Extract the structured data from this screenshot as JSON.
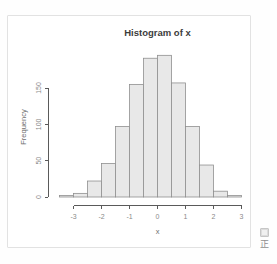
{
  "page": {
    "background": "#fefefe",
    "card_border_color": "#e2e2e2",
    "card_background": "#ffffff"
  },
  "chart_data": {
    "type": "bar",
    "subtype": "histogram",
    "title": "Histogram of x",
    "xlabel": "x",
    "ylabel": "Frequency",
    "bin_edges": [
      -3.5,
      -3,
      -2.5,
      -2,
      -1.5,
      -1,
      -0.5,
      0,
      0.5,
      1,
      1.5,
      2,
      2.5,
      3
    ],
    "counts": [
      2,
      5,
      22,
      46,
      97,
      155,
      191,
      195,
      157,
      97,
      44,
      8,
      2
    ],
    "x_ticks": [
      -3,
      -2,
      -1,
      0,
      1,
      2,
      3
    ],
    "y_ticks": [
      0,
      50,
      100,
      150
    ],
    "xlim": [
      -3.5,
      3.5
    ],
    "ylim": [
      0,
      195
    ],
    "grid": false,
    "legend": null,
    "colors": {
      "bar_fill": "#e8e8e8",
      "bar_stroke": "#8f8f8f",
      "axis": "#5a5a5a",
      "tick_label": "#8a8a8a",
      "title": "#3c3c3c",
      "axis_label": "#6e6e6e"
    }
  },
  "corner": {
    "icon": "image-placeholder-icon",
    "text": "正"
  }
}
